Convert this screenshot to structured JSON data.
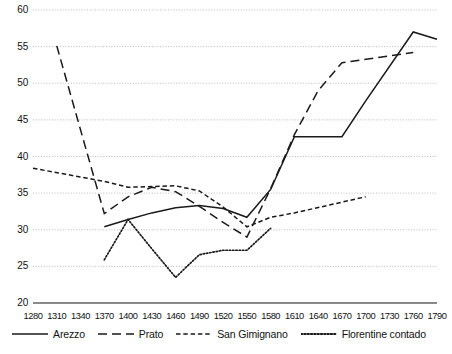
{
  "chart_data": {
    "type": "line",
    "title": "",
    "subtitle": "",
    "xlabel": "",
    "ylabel": "",
    "xlim": [
      1280,
      1790
    ],
    "ylim": [
      20,
      60
    ],
    "ytick_step": 5,
    "xtick_step": 30,
    "grid": true,
    "grid_style": "dotted horizontal",
    "legend_position": "bottom",
    "xticks": [
      1280,
      1310,
      1340,
      1370,
      1400,
      1430,
      1460,
      1490,
      1520,
      1550,
      1580,
      1610,
      1640,
      1670,
      1700,
      1730,
      1760,
      1790
    ],
    "yticks": [
      20,
      25,
      30,
      35,
      40,
      45,
      50,
      55,
      60
    ],
    "series": [
      {
        "name": "Arezzo",
        "style": "solid",
        "color": "#1a1a1a",
        "x": [
          1370,
          1400,
          1430,
          1460,
          1490,
          1520,
          1550,
          1580,
          1610,
          1640,
          1670,
          1700,
          1760,
          1790
        ],
        "values": [
          30.4,
          31.4,
          32.3,
          33.0,
          33.3,
          32.9,
          31.7,
          35.5,
          42.7,
          42.7,
          42.7,
          47.6,
          57.0,
          56.0
        ]
      },
      {
        "name": "Prato",
        "style": "long-dash",
        "color": "#1a1a1a",
        "x": [
          1310,
          1370,
          1400,
          1430,
          1460,
          1490,
          1520,
          1550,
          1580,
          1610,
          1640,
          1670,
          1760
        ],
        "values": [
          55.1,
          32.2,
          34.5,
          35.8,
          35.2,
          33.2,
          31.0,
          29.0,
          35.6,
          43.0,
          49.0,
          52.8,
          54.2
        ]
      },
      {
        "name": "San Gimignano",
        "style": "short-dash",
        "color": "#1a1a1a",
        "x": [
          1280,
          1370,
          1400,
          1430,
          1460,
          1490,
          1520,
          1550,
          1580,
          1610,
          1700
        ],
        "values": [
          38.4,
          36.6,
          35.8,
          35.9,
          36.0,
          35.3,
          33.1,
          30.4,
          31.7,
          32.3,
          34.5
        ]
      },
      {
        "name": "Florentine contado",
        "style": "dotted",
        "color": "#1a1a1a",
        "x": [
          1370,
          1400,
          1430,
          1460,
          1490,
          1520,
          1550,
          1580
        ],
        "values": [
          25.9,
          31.4,
          27.4,
          23.5,
          26.6,
          27.2,
          27.2,
          30.2
        ]
      }
    ]
  },
  "legend": {
    "items": [
      {
        "label": "Arezzo",
        "style": "solid"
      },
      {
        "label": "Prato",
        "style": "long-dash"
      },
      {
        "label": "San Gimignano",
        "style": "short-dash"
      },
      {
        "label": "Florentine contado",
        "style": "dotted"
      }
    ]
  }
}
